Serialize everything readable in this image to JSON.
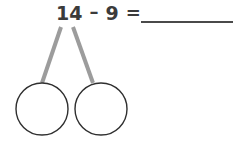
{
  "page": {
    "background_color": "#ffffff"
  },
  "equation": {
    "minuend": "14",
    "operator": "–",
    "subtrahend": "9",
    "equals": "=",
    "answer_value": "",
    "answer_placeholder": "",
    "full_text": "14 – 9 = ____",
    "text_color": "#3b3b3b"
  },
  "answer_blank": {
    "label": "answer blank",
    "line_color": "#4a4a4a",
    "x": 141,
    "y": 21,
    "width": 92
  },
  "number_bond": {
    "label": "number bond",
    "branch_color": "#9c9c9c",
    "circle_stroke_color": "#2f2f2f",
    "circle_fill_color": "#ffffff",
    "branches": [
      {
        "name": "left-branch",
        "x1": 61,
        "y1": 27,
        "x2": 42,
        "y2": 83
      },
      {
        "name": "right-branch",
        "x1": 73,
        "y1": 27,
        "x2": 93,
        "y2": 83
      }
    ],
    "circles": [
      {
        "name": "left-part-circle",
        "cx": 42,
        "cy": 109,
        "r": 26,
        "value": ""
      },
      {
        "name": "right-part-circle",
        "cx": 101,
        "cy": 109,
        "r": 26,
        "value": ""
      }
    ]
  }
}
